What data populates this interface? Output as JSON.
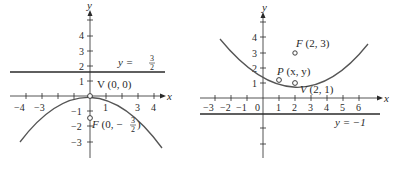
{
  "figures": [
    {
      "id": "left",
      "axis_labels": {
        "x": "x",
        "y": "y"
      },
      "x_ticks": [
        "−4",
        "−3",
        "1",
        "3",
        "4"
      ],
      "y_ticks": [
        "4",
        "3",
        "2",
        "1",
        "−1",
        "−2",
        "−3"
      ],
      "directrix_label": {
        "prefix": "y = ",
        "num": "3",
        "den": "2"
      },
      "vertex_label": "V (0, 0)",
      "focus_label": {
        "letter": "F",
        "text": " (0, −",
        "num": "3",
        "den": "2",
        "close": ")"
      },
      "curve": "parabola opening downward, vertex (0,0), focus (0,−3/2), directrix y = 3/2"
    },
    {
      "id": "right",
      "axis_labels": {
        "x": "x",
        "y": "y"
      },
      "x_ticks": [
        "−3",
        "−2",
        "−1",
        "0",
        "1",
        "2",
        "3",
        "4",
        "5",
        "6"
      ],
      "y_ticks": [
        "4",
        "3",
        "2",
        "1"
      ],
      "directrix_label": "y =  −1",
      "focus_label": {
        "letter": "F",
        "text": " (2, 3)"
      },
      "point_label": {
        "letter": "P",
        "text": " (x, y)"
      },
      "vertex_label": {
        "letter": "V",
        "text": " (2, 1)"
      },
      "curve": "parabola opening upward, vertex (2,1), focus (2,3), directrix y = −1"
    }
  ],
  "colors": {
    "ink": "#2a2a2a",
    "curve": "#555555",
    "background": "#ffffff"
  }
}
